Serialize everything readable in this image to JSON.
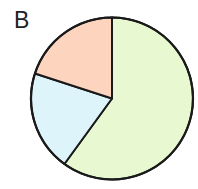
{
  "panel_label": "B",
  "chart_data": {
    "type": "pie",
    "title": "B",
    "categories": [
      "Green",
      "Blue",
      "Orange"
    ],
    "values": [
      60,
      20,
      20
    ],
    "unit": "percent (estimated from slice angles)",
    "start_angle_deg": 0,
    "direction": "clockwise from 12 o'clock",
    "colors": [
      "#e8f8d0",
      "#ddf4fb",
      "#fdd5bf"
    ],
    "outline_color": "#1a1a1a",
    "legend": "none",
    "data_labels": "none"
  }
}
